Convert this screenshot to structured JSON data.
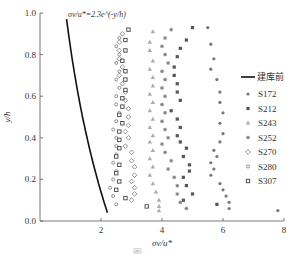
{
  "chart_data": {
    "type": "scatter",
    "title": "",
    "xlabel": "σv/u*",
    "ylabel": "y/h",
    "xlim": [
      0,
      8
    ],
    "ylim": [
      0,
      1.0
    ],
    "xticks": [
      "2",
      "4",
      "6",
      "8"
    ],
    "yticks": [
      "0.0",
      "0.2",
      "0.4",
      "0.6",
      "0.8",
      "1.0"
    ],
    "grid": false,
    "legend_position": "right",
    "annotation": "σv/u*=2.3e^(-y/h)",
    "curve": {
      "name": "建库前",
      "equation": "2.3*exp(-y)",
      "y_range": [
        0.04,
        0.97
      ]
    },
    "series": [
      {
        "name": "S172",
        "marker": "dot",
        "color": "#777777",
        "points": [
          [
            5.5,
            0.93
          ],
          [
            5.6,
            0.85
          ],
          [
            5.7,
            0.78
          ],
          [
            5.6,
            0.73
          ],
          [
            5.8,
            0.68
          ],
          [
            5.9,
            0.62
          ],
          [
            5.9,
            0.57
          ],
          [
            6.0,
            0.52
          ],
          [
            5.9,
            0.47
          ],
          [
            6.0,
            0.42
          ],
          [
            5.9,
            0.38
          ],
          [
            5.7,
            0.34
          ],
          [
            5.8,
            0.31
          ],
          [
            5.6,
            0.28
          ],
          [
            5.7,
            0.25
          ],
          [
            5.6,
            0.22
          ],
          [
            5.9,
            0.18
          ],
          [
            6.0,
            0.15
          ],
          [
            6.1,
            0.12
          ],
          [
            6.2,
            0.09
          ],
          [
            6.2,
            0.06
          ],
          [
            7.8,
            0.05
          ]
        ]
      },
      {
        "name": "S212",
        "marker": "square",
        "color": "#555555",
        "points": [
          [
            5.0,
            0.93
          ],
          [
            4.8,
            0.87
          ],
          [
            4.6,
            0.83
          ],
          [
            4.5,
            0.79
          ],
          [
            4.4,
            0.74
          ],
          [
            4.4,
            0.7
          ],
          [
            4.5,
            0.66
          ],
          [
            4.5,
            0.62
          ],
          [
            4.6,
            0.58
          ],
          [
            4.3,
            0.53
          ],
          [
            4.5,
            0.49
          ],
          [
            4.6,
            0.45
          ],
          [
            4.5,
            0.41
          ],
          [
            4.6,
            0.38
          ],
          [
            4.8,
            0.35
          ],
          [
            4.7,
            0.31
          ],
          [
            4.9,
            0.27
          ],
          [
            4.9,
            0.24
          ],
          [
            4.7,
            0.21
          ],
          [
            4.8,
            0.17
          ],
          [
            5.0,
            0.13
          ],
          [
            4.7,
            0.1
          ],
          [
            5.8,
            0.08
          ]
        ]
      },
      {
        "name": "S243",
        "marker": "triangle",
        "color": "#aaaaaa",
        "points": [
          [
            3.7,
            0.91
          ],
          [
            3.6,
            0.86
          ],
          [
            3.6,
            0.82
          ],
          [
            3.7,
            0.77
          ],
          [
            3.6,
            0.73
          ],
          [
            3.7,
            0.69
          ],
          [
            3.7,
            0.65
          ],
          [
            3.6,
            0.61
          ],
          [
            3.7,
            0.57
          ],
          [
            3.6,
            0.53
          ],
          [
            3.7,
            0.49
          ],
          [
            3.6,
            0.45
          ],
          [
            3.7,
            0.41
          ],
          [
            3.6,
            0.38
          ],
          [
            3.7,
            0.34
          ],
          [
            3.6,
            0.3
          ],
          [
            3.7,
            0.26
          ],
          [
            3.6,
            0.22
          ],
          [
            3.7,
            0.18
          ],
          [
            3.8,
            0.14
          ],
          [
            3.9,
            0.1
          ],
          [
            3.9,
            0.07
          ],
          [
            3.9,
            0.05
          ]
        ]
      },
      {
        "name": "S252",
        "marker": "asterisk",
        "color": "#888888",
        "points": [
          [
            4.3,
            0.92
          ],
          [
            4.1,
            0.88
          ],
          [
            4.0,
            0.84
          ],
          [
            4.1,
            0.8
          ],
          [
            4.2,
            0.76
          ],
          [
            4.0,
            0.72
          ],
          [
            4.1,
            0.68
          ],
          [
            4.0,
            0.64
          ],
          [
            4.1,
            0.6
          ],
          [
            4.0,
            0.56
          ],
          [
            4.1,
            0.52
          ],
          [
            4.0,
            0.48
          ],
          [
            4.1,
            0.44
          ],
          [
            4.2,
            0.4
          ],
          [
            4.0,
            0.37
          ],
          [
            4.1,
            0.33
          ],
          [
            4.3,
            0.29
          ],
          [
            4.2,
            0.25
          ],
          [
            4.4,
            0.21
          ],
          [
            4.5,
            0.17
          ],
          [
            4.5,
            0.13
          ],
          [
            4.6,
            0.09
          ],
          [
            4.8,
            0.06
          ]
        ]
      },
      {
        "name": "S270",
        "marker": "diamond-open",
        "color": "#666666",
        "points": [
          [
            2.7,
            0.9
          ],
          [
            2.6,
            0.86
          ],
          [
            2.6,
            0.82
          ],
          [
            2.6,
            0.78
          ],
          [
            2.7,
            0.74
          ],
          [
            2.6,
            0.7
          ],
          [
            2.7,
            0.66
          ],
          [
            2.8,
            0.62
          ],
          [
            2.8,
            0.58
          ],
          [
            2.9,
            0.54
          ],
          [
            2.9,
            0.5
          ],
          [
            2.9,
            0.46
          ],
          [
            2.8,
            0.43
          ],
          [
            2.9,
            0.4
          ],
          [
            2.8,
            0.36
          ],
          [
            3.0,
            0.33
          ],
          [
            3.0,
            0.29
          ],
          [
            3.1,
            0.26
          ],
          [
            3.1,
            0.22
          ],
          [
            3.0,
            0.19
          ],
          [
            3.1,
            0.16
          ],
          [
            3.1,
            0.13
          ],
          [
            3.0,
            0.1
          ]
        ]
      },
      {
        "name": "S280",
        "marker": "circle-open",
        "color": "#666666",
        "points": [
          [
            2.6,
            0.88
          ],
          [
            2.5,
            0.84
          ],
          [
            2.6,
            0.8
          ],
          [
            2.5,
            0.76
          ],
          [
            2.6,
            0.72
          ],
          [
            2.5,
            0.68
          ],
          [
            2.6,
            0.64
          ],
          [
            2.5,
            0.6
          ],
          [
            2.5,
            0.56
          ],
          [
            2.6,
            0.52
          ],
          [
            2.5,
            0.48
          ],
          [
            2.4,
            0.44
          ],
          [
            2.5,
            0.4
          ],
          [
            2.5,
            0.36
          ],
          [
            2.5,
            0.32
          ],
          [
            2.4,
            0.28
          ],
          [
            2.5,
            0.24
          ],
          [
            2.4,
            0.2
          ],
          [
            2.3,
            0.16
          ],
          [
            2.4,
            0.12
          ],
          [
            2.5,
            0.08
          ]
        ]
      },
      {
        "name": "S307",
        "marker": "square-open",
        "color": "#444444",
        "points": [
          [
            2.9,
            0.92
          ],
          [
            2.8,
            0.87
          ],
          [
            2.8,
            0.82
          ],
          [
            2.7,
            0.77
          ],
          [
            2.8,
            0.72
          ],
          [
            2.8,
            0.68
          ],
          [
            2.8,
            0.63
          ],
          [
            2.7,
            0.59
          ],
          [
            2.7,
            0.55
          ],
          [
            2.6,
            0.51
          ],
          [
            2.7,
            0.47
          ],
          [
            2.6,
            0.43
          ],
          [
            2.6,
            0.39
          ],
          [
            2.6,
            0.35
          ],
          [
            2.5,
            0.31
          ],
          [
            2.6,
            0.27
          ],
          [
            2.5,
            0.23
          ],
          [
            2.6,
            0.19
          ],
          [
            2.5,
            0.15
          ],
          [
            2.8,
            0.11
          ],
          [
            3.5,
            0.07
          ]
        ]
      }
    ]
  },
  "caption": "图 ……"
}
